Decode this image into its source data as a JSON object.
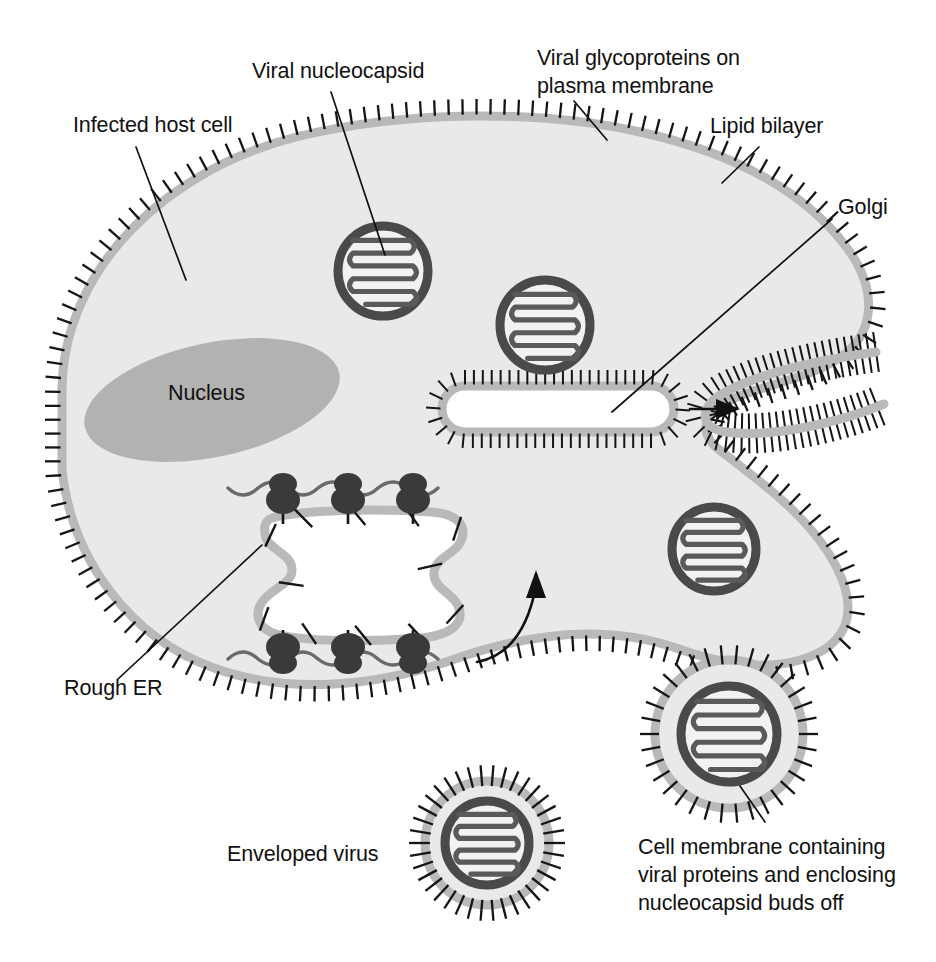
{
  "figure": {
    "background_color": "#ffffff",
    "width": 936,
    "height": 962
  },
  "palette": {
    "cytoplasm": "#e9e9e7",
    "membrane_band": "#b9b9b7",
    "nucleus": "#b2b2b0",
    "nucleocapsid_ring": "#4a4a4a",
    "nucleocapsid_helix": "#5a5a5a",
    "ribosome": "#3a3a3a",
    "spike": "#151515",
    "lumen": "#ffffff",
    "text": "#111111"
  },
  "labels": {
    "infected_host_cell": {
      "text": "Infected host cell",
      "x": 73,
      "y": 132
    },
    "viral_nucleocapsid": {
      "text": "Viral nucleocapsid",
      "x": 252,
      "y": 78
    },
    "viral_glycoproteins": {
      "line1": "Viral glycoproteins on",
      "line2": "plasma membrane",
      "x": 537,
      "y": 65
    },
    "lipid_bilayer": {
      "text": "Lipid bilayer",
      "x": 710,
      "y": 133
    },
    "golgi": {
      "text": "Golgi",
      "x": 838,
      "y": 214
    },
    "nucleus": {
      "text": "Nucleus",
      "x": 168,
      "y": 400
    },
    "rough_er": {
      "text": "Rough ER",
      "x": 64,
      "y": 695
    },
    "enveloped_virus": {
      "text": "Enveloped virus",
      "x": 227,
      "y": 861
    },
    "budding_caption": {
      "line1": "Cell membrane containing",
      "line2": "viral proteins and enclosing",
      "line3": "nucleocapsid buds off",
      "x": 638,
      "y": 854
    }
  },
  "structures": {
    "host_cell": {
      "name": "Infected host cell",
      "description": "Large irregular oval cytoplasm bounded by a spiked plasma membrane with a notch on the right side",
      "membrane_spike_count": 180
    },
    "nucleus": {
      "name": "Nucleus",
      "shape": "rotated solid gray ellipse",
      "cx": 212,
      "cy": 400,
      "rx": 130,
      "ry": 57,
      "rotation_deg": -12
    },
    "rough_er": {
      "name": "Rough ER",
      "description": "White lumen bounded by gray membrane with internal spikes; ribosomes studded on cytoplasmic face along mRNA strands",
      "ribosome_rows": 2,
      "ribosomes_per_row": 3,
      "internal_spike_count": 12
    },
    "golgi_left": {
      "name": "Golgi cisterna (left)",
      "shape": "elongated stadium, white lumen, spikes outward",
      "cx": 560,
      "cy": 409
    },
    "golgi_right": {
      "name": "Golgi cisterna (right)",
      "shape": "curved J-shaped cisterna, white lumen, spikes outward",
      "cx": 780,
      "cy": 405
    },
    "nucleocapsids": [
      {
        "id": "nucleocapsid-1",
        "cx": 383,
        "cy": 271,
        "r": 45
      },
      {
        "id": "nucleocapsid-2",
        "cx": 545,
        "cy": 325,
        "r": 45
      },
      {
        "id": "nucleocapsid-3",
        "cx": 714,
        "cy": 549,
        "r": 42
      }
    ],
    "budding_virion": {
      "name": "Budding virion",
      "description": "Nucleocapsid enclosed by outpouching cell membrane studded with viral glycoprotein spikes",
      "cx": 729,
      "cy": 734,
      "r": 74
    },
    "enveloped_virus": {
      "name": "Enveloped virus",
      "description": "Free virion: nucleocapsid within lipid envelope bearing radiating glycoprotein spikes",
      "cx": 487,
      "cy": 843,
      "r": 76
    },
    "transport_arrows": [
      {
        "id": "er-to-golgi-arrow",
        "description": "curved arrow from rough ER up to Golgi"
      },
      {
        "id": "golgi-to-golgi-arrow",
        "description": "straight arrow between left and right Golgi cisternae"
      }
    ]
  }
}
